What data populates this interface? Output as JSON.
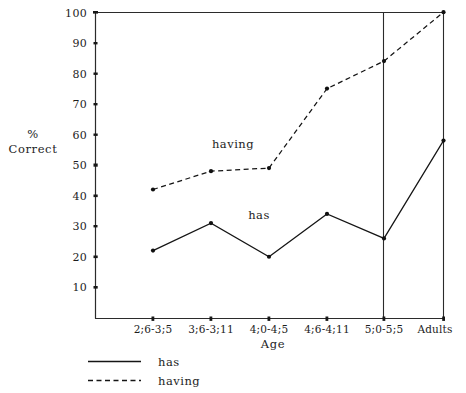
{
  "chart_data": {
    "type": "line",
    "title": "",
    "xlabel": "Age",
    "ylabel": "% Correct",
    "ylabel_line1": "%",
    "ylabel_line2": "Correct",
    "categories": [
      "2;6-3;5",
      "3;6-3;11",
      "4;0-4;5",
      "4;6-4;11",
      "5;0-5;5",
      "Adults"
    ],
    "ylim": [
      0,
      100
    ],
    "yticks": [
      10,
      20,
      30,
      40,
      50,
      60,
      70,
      80,
      90,
      100
    ],
    "ytick_labels": [
      "10",
      "20",
      "30",
      "40",
      "50",
      "60",
      "70",
      "80",
      "90",
      "100"
    ],
    "grid": false,
    "legend_position": "below-left",
    "series": [
      {
        "name": "has",
        "style": "solid",
        "values": [
          22,
          31,
          20,
          34,
          26,
          58
        ]
      },
      {
        "name": "having",
        "style": "dashed",
        "values": [
          42,
          48,
          49,
          75,
          84,
          100
        ]
      }
    ],
    "annotations": [
      {
        "text": "having",
        "x_px": 233,
        "y_px": 148
      },
      {
        "text": "has",
        "x_px": 259,
        "y_px": 218
      }
    ]
  },
  "legend": {
    "items": [
      {
        "label": "has",
        "style": "solid"
      },
      {
        "label": "having",
        "style": "dashed"
      }
    ]
  },
  "axes": {
    "x_title": "Age",
    "y_title_line1": "%",
    "y_title_line2": "Correct"
  }
}
